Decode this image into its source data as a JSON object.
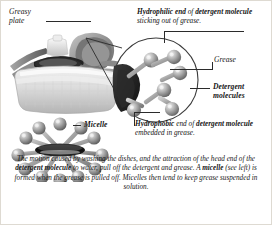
{
  "figure": {
    "background_color": "#ffffff",
    "frame_color": "#dedad2",
    "ink_color": "#161616"
  },
  "labels": {
    "greasy_plate": "Greasy\nplate",
    "grease": "Grease",
    "detergent_molecules": "Detergent\nmolecules",
    "micelle": "Micelle"
  },
  "callouts": {
    "hydrophilic": {
      "bold_lead": "Hydrophilic end",
      "mid": " of ",
      "bold_two": "detergent molecule",
      "tail": " sticking out of grease."
    },
    "hydrophobic": {
      "bold_lead": "Hydrophobic",
      "mid": " end of ",
      "bold_two": "detergent molecule",
      "tail": " embedded in grease."
    }
  },
  "caption": {
    "part1": "The motion caused by washing the dishes, and the attraction of the head end of the ",
    "bold1": "detergent molecule",
    "part2": " to water, pull off the detergent and grease. A ",
    "bold2": "micelle",
    "part3": " (see left) is formed when the grease is pulled off. Micelles then tend to keep grease suspended in solution."
  },
  "artwork": {
    "dish_rack": "dish-rack-with-greasy-plates-illustration",
    "magnifier": "magnified-grease-surface-circle",
    "micelle": "micelle-sphere-with-radiating-detergent-molecules",
    "molecule_count_magnifier": 6,
    "molecule_count_micelle": 12,
    "palette": {
      "sphere_light": "#d8d8d8",
      "sphere_mid": "#9a9a9a",
      "sphere_dark": "#5d5d5d",
      "core_dark": "#1c1c1c",
      "rack_light": "#e9e9e9",
      "rack_mid": "#bdbdbd",
      "rack_dark": "#7d7d7d"
    }
  }
}
